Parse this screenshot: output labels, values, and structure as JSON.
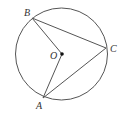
{
  "diagram": {
    "type": "circle-inscribed-geometry",
    "colors": {
      "stroke": "#555555",
      "label": "#333333",
      "center_dot": "#111111",
      "background": "#ffffff"
    },
    "circle": {
      "center": [
        61.5,
        54
      ],
      "radius": 46
    },
    "points": {
      "A": {
        "label": "A",
        "x": 43,
        "y": 98,
        "label_x": 36,
        "label_y": 109
      },
      "B": {
        "label": "B",
        "x": 32,
        "y": 18,
        "label_x": 24,
        "label_y": 16
      },
      "C": {
        "label": "C",
        "x": 106,
        "y": 48,
        "label_x": 110,
        "label_y": 52
      },
      "O": {
        "label": "O",
        "x": 62,
        "y": 54,
        "label_x": 50,
        "label_y": 59
      }
    },
    "segments": [
      {
        "name": "segment-BC",
        "from": "B",
        "to": "C"
      },
      {
        "name": "segment-CA",
        "from": "C",
        "to": "A"
      },
      {
        "name": "segment-BO",
        "from": "B",
        "to": "O"
      },
      {
        "name": "segment-OA",
        "from": "O",
        "to": "A"
      }
    ]
  }
}
